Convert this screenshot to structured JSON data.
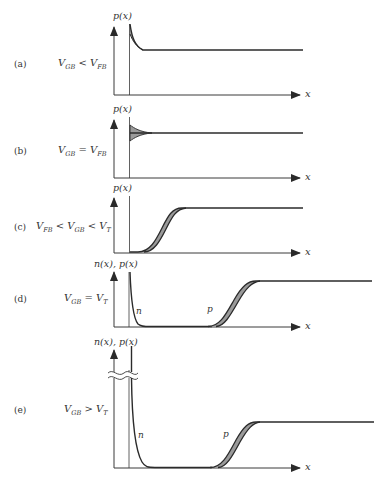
{
  "figure": {
    "panels": [
      {
        "id": "a",
        "label": "(a)",
        "condition": {
          "lhs": "V",
          "lhs_sub": "GB",
          "op": "<",
          "rhs": "V",
          "rhs_sub": "FB"
        },
        "ylabel": "p(x)",
        "xlabel": "x",
        "description": "Accumulation: hole concentration peaks at surface and decays to bulk"
      },
      {
        "id": "b",
        "label": "(b)",
        "condition": {
          "lhs": "V",
          "lhs_sub": "GB",
          "op": "=",
          "rhs": "V",
          "rhs_sub": "FB"
        },
        "ylabel": "p(x)",
        "xlabel": "x",
        "description": "Flat band: hole concentration uniform at bulk value (shaded uncertainty near surface)"
      },
      {
        "id": "c",
        "label": "(c)",
        "condition": {
          "lhs": "V",
          "lhs_sub": "FB",
          "op": "<",
          "mid": "V",
          "mid_sub": "GB",
          "op2": "<",
          "rhs": "V",
          "rhs_sub": "T"
        },
        "ylabel": "p(x)",
        "xlabel": "x",
        "description": "Depletion: holes depleted near surface, rise to bulk value"
      },
      {
        "id": "d",
        "label": "(d)",
        "condition": {
          "lhs": "V",
          "lhs_sub": "GB",
          "op": "=",
          "rhs": "V",
          "rhs_sub": "T"
        },
        "ylabel": "n(x), p(x)",
        "xlabel": "x",
        "curve_tags": [
          "n",
          "p"
        ],
        "description": "Threshold: thin electron layer at surface, holes depleted then rise to bulk"
      },
      {
        "id": "e",
        "label": "(e)",
        "condition": {
          "lhs": "V",
          "lhs_sub": "GB",
          "op": ">",
          "rhs": "V",
          "rhs_sub": "T"
        },
        "ylabel": "n(x), p(x)",
        "xlabel": "x",
        "curve_tags": [
          "n",
          "p"
        ],
        "axis_break": true,
        "description": "Inversion: large electron concentration at surface (axis broken), holes depleted then rise to bulk"
      }
    ]
  },
  "colors": {
    "line": "#2b2b2b",
    "shade": "#9a9a9a",
    "axis": "#3a3a3a"
  }
}
